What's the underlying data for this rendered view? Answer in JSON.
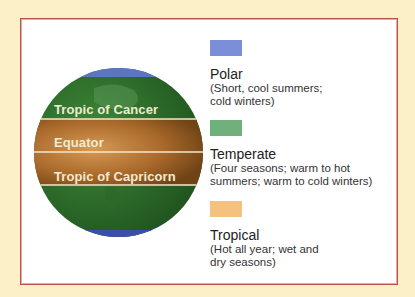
{
  "diagram": {
    "globe": {
      "lines": [
        {
          "label": "Tropic of Cancer"
        },
        {
          "label": "Equator"
        },
        {
          "label": "Tropic of Capricorn"
        }
      ]
    },
    "legend": [
      {
        "name": "Polar",
        "description_line1": "(Short, cool summers;",
        "description_line2": "cold winters)",
        "color": "#7b8fd8"
      },
      {
        "name": "Temperate",
        "description_line1": "(Four seasons; warm to hot",
        "description_line2": "summers; warm to cold winters)",
        "color": "#6fb07c"
      },
      {
        "name": "Tropical",
        "description_line1": "(Hot all year; wet and",
        "description_line2": "dry seasons)",
        "color": "#f5c17e"
      }
    ],
    "colors": {
      "background": "#fbf0c8",
      "border": "#c0504d",
      "polar_globe": "#5c74c4",
      "temperate_globe": "#2f6b2a",
      "tropical_globe": "#a8682a"
    }
  }
}
